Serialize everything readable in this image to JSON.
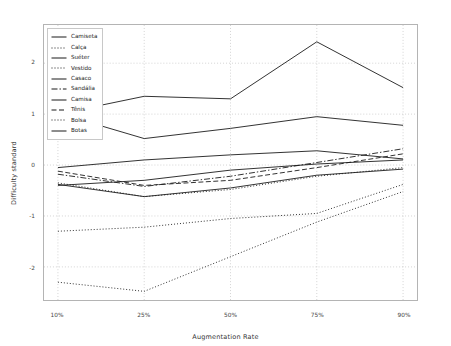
{
  "chart_data": {
    "type": "line",
    "title": "",
    "xlabel": "Augmentation Rate",
    "ylabel": "Difficulty standard",
    "categories": [
      "10%",
      "25%",
      "50%",
      "75%",
      "90%"
    ],
    "x_tick_labels": [
      "10%",
      "25%",
      "50%",
      "75%",
      "90%"
    ],
    "y_tick_labels": [
      "2",
      "1",
      "0",
      "-1",
      "-2"
    ],
    "y_ticks": [
      2,
      1,
      0,
      -1,
      -2
    ],
    "xlim": [
      0,
      4
    ],
    "ylim": [
      -2.65,
      2.75
    ],
    "grid": true,
    "legend_position": "upper left",
    "series": [
      {
        "name": "Camiseta",
        "style": "solid",
        "values": [
          1.0,
          1.35,
          1.3,
          2.42,
          1.52
        ]
      },
      {
        "name": "Calça",
        "style": "dotted",
        "values": [
          -2.3,
          -2.48,
          -1.8,
          -1.12,
          -0.52
        ]
      },
      {
        "name": "Suéter",
        "style": "solid",
        "values": [
          1.02,
          0.52,
          0.72,
          0.95,
          0.78
        ]
      },
      {
        "name": "Vestido",
        "style": "dotted",
        "values": [
          -1.3,
          -1.22,
          -1.05,
          -0.95,
          -0.38
        ]
      },
      {
        "name": "Casaco",
        "style": "solid",
        "values": [
          -0.05,
          0.1,
          0.2,
          0.28,
          0.12
        ]
      },
      {
        "name": "Sandália",
        "style": "dashdot",
        "values": [
          -0.18,
          -0.42,
          -0.22,
          0.05,
          0.32
        ]
      },
      {
        "name": "Camisa",
        "style": "solid",
        "values": [
          -0.4,
          -0.3,
          -0.1,
          0.02,
          0.1
        ]
      },
      {
        "name": "Tênis",
        "style": "dashed",
        "values": [
          -0.12,
          -0.4,
          -0.3,
          -0.05,
          0.22
        ]
      },
      {
        "name": "Bolsa",
        "style": "dotted",
        "values": [
          -0.35,
          -0.62,
          -0.48,
          -0.22,
          -0.05
        ]
      },
      {
        "name": "Botas",
        "style": "solid",
        "values": [
          -0.38,
          -0.62,
          -0.45,
          -0.2,
          -0.08
        ]
      }
    ],
    "line_color": "#1a1a1a",
    "grid_color": "#b0b0b0",
    "background": "#ffffff"
  }
}
